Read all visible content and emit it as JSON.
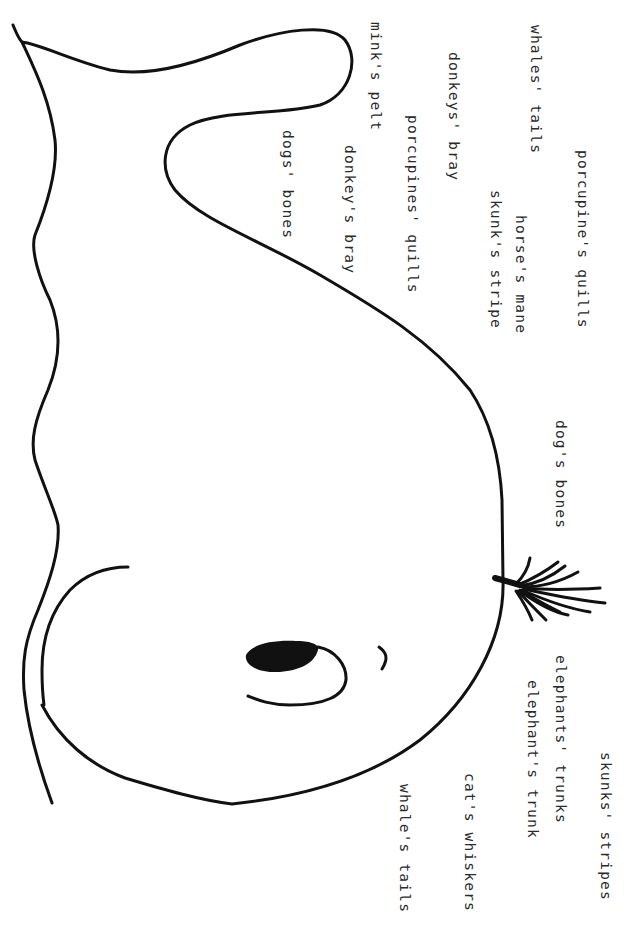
{
  "worksheet": {
    "orientation": "rotated-90-clockwise",
    "ink_color": "#111111",
    "text_color": "#2a2a2a",
    "drawing": {
      "subject": "whale",
      "parts": [
        "body-outline",
        "tail-fluke",
        "eye",
        "pupil",
        "brow",
        "flipper",
        "blowhole-spout"
      ]
    },
    "labels": [
      {
        "text": "porcupine's quills",
        "x": 575,
        "y": 150
      },
      {
        "text": "whales' tails",
        "x": 528,
        "y": 25
      },
      {
        "text": "horse's mane",
        "x": 513,
        "y": 215
      },
      {
        "text": "skunk's stripe",
        "x": 488,
        "y": 190
      },
      {
        "text": "donkeys' bray",
        "x": 446,
        "y": 52
      },
      {
        "text": "porcupines' quills",
        "x": 405,
        "y": 115
      },
      {
        "text": "mink's pelt",
        "x": 368,
        "y": 22
      },
      {
        "text": "donkey's bray",
        "x": 342,
        "y": 145
      },
      {
        "text": "dogs' bones",
        "x": 280,
        "y": 130
      },
      {
        "text": "dog's bones",
        "x": 553,
        "y": 420
      },
      {
        "text": "skunks' stripes",
        "x": 598,
        "y": 752
      },
      {
        "text": "elephants' trunks",
        "x": 553,
        "y": 655
      },
      {
        "text": "elephant's trunk",
        "x": 525,
        "y": 680
      },
      {
        "text": "cat's whiskers",
        "x": 462,
        "y": 773
      },
      {
        "text": "whale's tails",
        "x": 397,
        "y": 784
      }
    ]
  }
}
